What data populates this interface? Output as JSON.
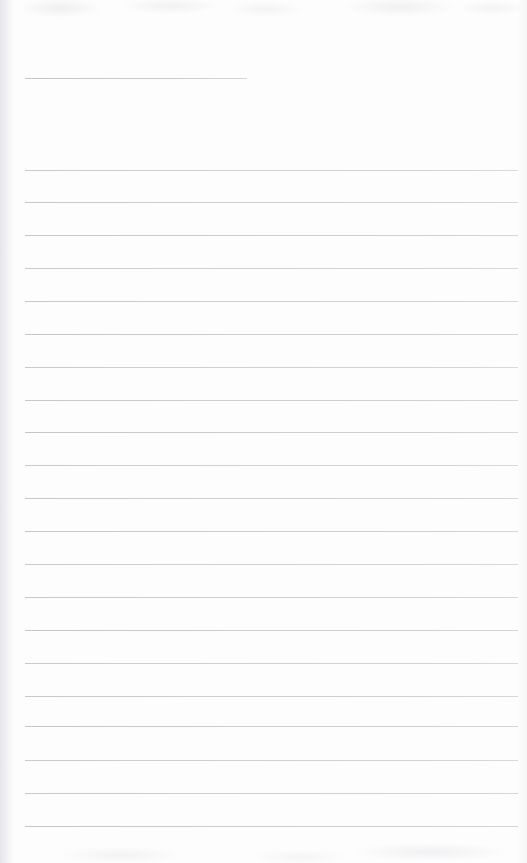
{
  "page": {
    "kind": "blank-lined-notebook-page",
    "width": 527,
    "height": 863,
    "background_color": "#fdfdfd",
    "rule_color": "#c9c9cf",
    "text_content": "",
    "line_count_total": 22,
    "full_width_line_count": 21,
    "short_line_count": 1
  },
  "rules": {
    "left_margin_x": 25,
    "right_margin_x": 518,
    "line_spacing_px": 32.8,
    "short_rule": {
      "label": "title-rule",
      "x": 25,
      "y": 78,
      "width": 222
    },
    "full_rules": [
      {
        "label": "rule-1",
        "y": 170
      },
      {
        "label": "rule-2",
        "y": 202
      },
      {
        "label": "rule-3",
        "y": 235
      },
      {
        "label": "rule-4",
        "y": 268
      },
      {
        "label": "rule-5",
        "y": 301
      },
      {
        "label": "rule-6",
        "y": 334
      },
      {
        "label": "rule-7",
        "y": 367
      },
      {
        "label": "rule-8",
        "y": 400
      },
      {
        "label": "rule-9",
        "y": 432
      },
      {
        "label": "rule-10",
        "y": 465
      },
      {
        "label": "rule-11",
        "y": 498
      },
      {
        "label": "rule-12",
        "y": 531
      },
      {
        "label": "rule-13",
        "y": 564
      },
      {
        "label": "rule-14",
        "y": 597
      },
      {
        "label": "rule-15",
        "y": 630
      },
      {
        "label": "rule-16",
        "y": 663
      },
      {
        "label": "rule-17",
        "y": 696
      },
      {
        "label": "rule-18",
        "y": 726
      },
      {
        "label": "rule-19",
        "y": 760
      },
      {
        "label": "rule-20",
        "y": 793
      },
      {
        "label": "rule-21",
        "y": 826
      }
    ]
  }
}
